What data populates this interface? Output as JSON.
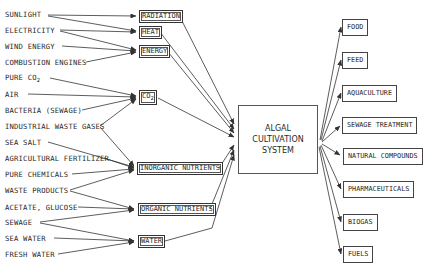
{
  "diagram": {
    "center": {
      "line1": "ALGAL",
      "line2": "CULTIVATION",
      "line3": "SYSTEM"
    },
    "sources": [
      {
        "label": "SUNLIGHT",
        "y": 15
      },
      {
        "label": "ELECTRICITY",
        "y": 30
      },
      {
        "label": "WIND ENERGY",
        "y": 46
      },
      {
        "label": "COMBUSTION ENGINES",
        "y": 62
      },
      {
        "label": "PURE CO",
        "sub": "2",
        "y": 78
      },
      {
        "label": "AIR",
        "y": 94
      },
      {
        "label": "BACTERIA (SEWAGE)",
        "y": 110
      },
      {
        "label": "INDUSTRIAL WASTE GASES",
        "y": 126
      },
      {
        "label": "SEA SALT",
        "y": 142
      },
      {
        "label": "AGRICULTURAL FERTILIZER",
        "y": 158
      },
      {
        "label": "PURE CHEMICALS",
        "y": 174
      },
      {
        "label": "WASTE PRODUCTS",
        "y": 190
      },
      {
        "label": "ACETATE, GLUCOSE",
        "y": 207
      },
      {
        "label": "SEWAGE",
        "y": 222
      },
      {
        "label": "SEA WATER",
        "y": 238
      },
      {
        "label": "FRESH WATER",
        "y": 254
      }
    ],
    "inputs": [
      {
        "label": "RADIATION",
        "y": 11
      },
      {
        "label": "HEAT",
        "y": 27
      },
      {
        "label": "ENERGY",
        "y": 45
      },
      {
        "label": "CO",
        "sub": "2",
        "y": 91
      },
      {
        "label": "INORGANIC NUTRIENTS",
        "y": 163
      },
      {
        "label": "ORGANIC NUTRIENTS",
        "y": 204
      },
      {
        "label": "WATER",
        "y": 236
      }
    ],
    "outputs": [
      {
        "label": "FOOD",
        "y": 19
      },
      {
        "label": "FEED",
        "y": 52
      },
      {
        "label": "AQUACULTURE",
        "y": 85
      },
      {
        "label": "SEWAGE TREATMENT",
        "y": 117
      },
      {
        "label": "NATURAL COMPOUNDS",
        "y": 148
      },
      {
        "label": "PHARMACEUTICALS",
        "y": 181
      },
      {
        "label": "BIOGAS",
        "y": 214
      },
      {
        "label": "FUELS",
        "y": 246
      }
    ]
  }
}
